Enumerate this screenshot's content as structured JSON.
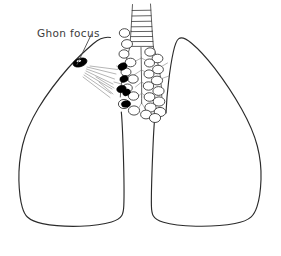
{
  "figure": {
    "background_color": "#ffffff",
    "ink_color": "#2b2b2b",
    "lesion_color": "#000000",
    "label_color": "#3b3b3b",
    "width": 281,
    "height": 256
  },
  "labels": {
    "ghon_focus": "Ghon focus"
  },
  "annotations": {
    "leader_line": {
      "from_x": 88,
      "from_y": 36,
      "to_x": 79,
      "to_y": 62
    }
  },
  "anatomy": {
    "left_lung": "left-lung-outline",
    "right_lung": "right-lung-outline",
    "trachea": "trachea",
    "bronchial_tree": "bronchial-tree",
    "hilar_nodes_infected_count": 5,
    "hilar_nodes_normal_count": 24,
    "lymphatic_streaks_count": 9
  }
}
